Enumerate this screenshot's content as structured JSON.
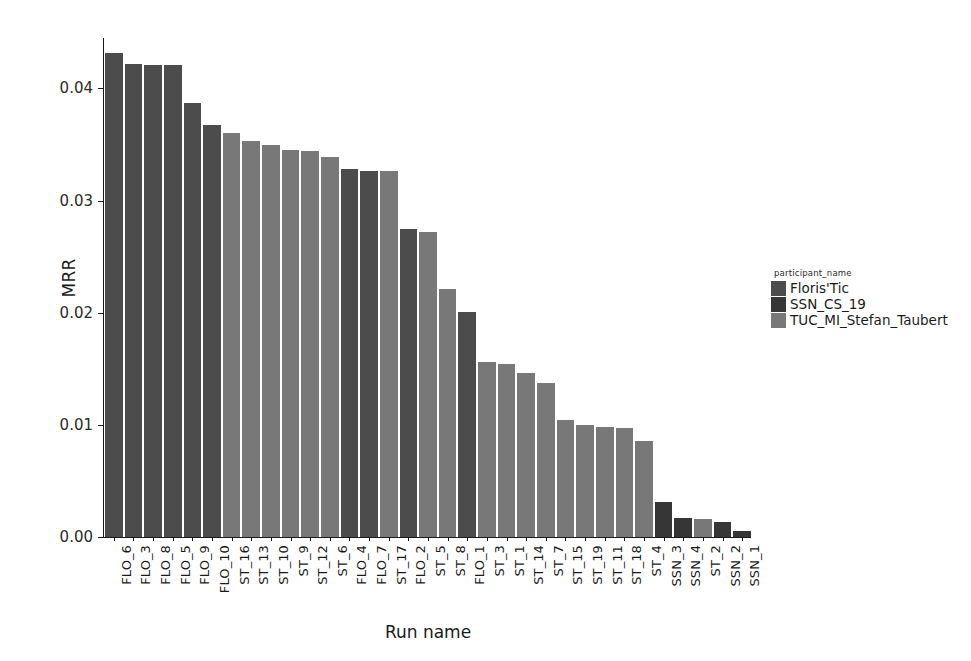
{
  "chart_data": {
    "type": "bar",
    "title": "",
    "xlabel": "Run name",
    "ylabel": "MRR",
    "ylim": [
      0.0,
      0.0445
    ],
    "ytick_labels": [
      "0.00",
      "0.01",
      "0.02",
      "0.03",
      "0.04"
    ],
    "ytick_values": [
      0.0,
      0.01,
      0.02,
      0.03,
      0.04
    ],
    "grid": false,
    "legend_position": "right",
    "legend_title": "participant_name",
    "categories": [
      "FLO_6",
      "FLO_3",
      "FLO_8",
      "FLO_5",
      "FLO_9",
      "FLO_10",
      "ST_16",
      "ST_13",
      "ST_10",
      "ST_9",
      "ST_12",
      "ST_6",
      "FLO_4",
      "FLO_7",
      "ST_17",
      "FLO_2",
      "ST_5",
      "ST_8",
      "FLO_1",
      "ST_3",
      "ST_1",
      "ST_14",
      "ST_7",
      "ST_15",
      "ST_19",
      "ST_11",
      "ST_18",
      "ST_4",
      "SSN_3",
      "SSN_4",
      "ST_2",
      "SSN_2",
      "SSN_1"
    ],
    "values": [
      0.0432,
      0.0422,
      0.0421,
      0.0421,
      0.0387,
      0.0367,
      0.036,
      0.0353,
      0.035,
      0.0345,
      0.0344,
      0.0339,
      0.0328,
      0.0326,
      0.0326,
      0.0275,
      0.0272,
      0.0221,
      0.0201,
      0.0156,
      0.0154,
      0.0146,
      0.0137,
      0.0104,
      0.01,
      0.0098,
      0.0097,
      0.0086,
      0.0031,
      0.0017,
      0.0016,
      0.0013,
      0.0005
    ],
    "groups": [
      "Floris'Tic",
      "Floris'Tic",
      "Floris'Tic",
      "Floris'Tic",
      "Floris'Tic",
      "Floris'Tic",
      "TUC_MI_Stefan_Taubert",
      "TUC_MI_Stefan_Taubert",
      "TUC_MI_Stefan_Taubert",
      "TUC_MI_Stefan_Taubert",
      "TUC_MI_Stefan_Taubert",
      "TUC_MI_Stefan_Taubert",
      "Floris'Tic",
      "Floris'Tic",
      "TUC_MI_Stefan_Taubert",
      "Floris'Tic",
      "TUC_MI_Stefan_Taubert",
      "TUC_MI_Stefan_Taubert",
      "Floris'Tic",
      "TUC_MI_Stefan_Taubert",
      "TUC_MI_Stefan_Taubert",
      "TUC_MI_Stefan_Taubert",
      "TUC_MI_Stefan_Taubert",
      "TUC_MI_Stefan_Taubert",
      "TUC_MI_Stefan_Taubert",
      "TUC_MI_Stefan_Taubert",
      "TUC_MI_Stefan_Taubert",
      "TUC_MI_Stefan_Taubert",
      "SSN_CS_19",
      "SSN_CS_19",
      "TUC_MI_Stefan_Taubert",
      "SSN_CS_19",
      "SSN_CS_19"
    ],
    "series": [
      {
        "name": "Floris'Tic",
        "color": "#4c4c4c"
      },
      {
        "name": "SSN_CS_19",
        "color": "#363636"
      },
      {
        "name": "TUC_MI_Stefan_Taubert",
        "color": "#787878"
      }
    ]
  },
  "legend": {
    "title": "participant_name",
    "entries": [
      {
        "label": "Floris'Tic",
        "color": "#4c4c4c"
      },
      {
        "label": "SSN_CS_19",
        "color": "#363636"
      },
      {
        "label": "TUC_MI_Stefan_Taubert",
        "color": "#787878"
      }
    ]
  }
}
